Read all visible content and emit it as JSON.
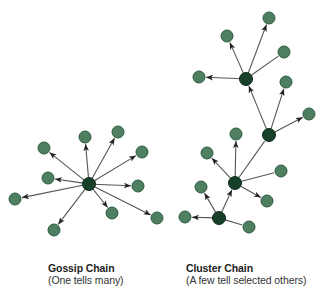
{
  "colors": {
    "hub_fill": "#17402a",
    "hub_stroke": "#0e2c1c",
    "leaf_fill": "#4d7f60",
    "leaf_stroke": "#2c5a3e",
    "edge": "#555555",
    "arrow": "#222222"
  },
  "diagrams": [
    {
      "id": "gossip",
      "title": "Gossip Chain",
      "subtitle": "(One tells many)",
      "nodes": [
        {
          "id": "g0",
          "x": 89,
          "y": 184,
          "type": "hub"
        },
        {
          "id": "g1",
          "x": 85,
          "y": 137,
          "type": "leaf"
        },
        {
          "id": "g2",
          "x": 118,
          "y": 132,
          "type": "leaf"
        },
        {
          "id": "g3",
          "x": 142,
          "y": 152,
          "type": "leaf"
        },
        {
          "id": "g4",
          "x": 44,
          "y": 148,
          "type": "leaf"
        },
        {
          "id": "g5",
          "x": 48,
          "y": 178,
          "type": "leaf"
        },
        {
          "id": "g6",
          "x": 138,
          "y": 186,
          "type": "leaf"
        },
        {
          "id": "g7",
          "x": 15,
          "y": 199,
          "type": "leaf"
        },
        {
          "id": "g8",
          "x": 112,
          "y": 213,
          "type": "leaf"
        },
        {
          "id": "g9",
          "x": 157,
          "y": 218,
          "type": "leaf"
        },
        {
          "id": "g10",
          "x": 54,
          "y": 230,
          "type": "leaf"
        }
      ],
      "edges": [
        {
          "from": "g0",
          "to": "g1",
          "arrow": true
        },
        {
          "from": "g0",
          "to": "g2",
          "arrow": true
        },
        {
          "from": "g0",
          "to": "g3",
          "arrow": true
        },
        {
          "from": "g0",
          "to": "g4",
          "arrow": true
        },
        {
          "from": "g0",
          "to": "g5",
          "arrow": true
        },
        {
          "from": "g0",
          "to": "g6",
          "arrow": true
        },
        {
          "from": "g0",
          "to": "g7",
          "arrow": true
        },
        {
          "from": "g0",
          "to": "g8",
          "arrow": true
        },
        {
          "from": "g0",
          "to": "g9",
          "arrow": true
        },
        {
          "from": "g0",
          "to": "g10",
          "arrow": true
        }
      ]
    },
    {
      "id": "cluster",
      "title": "Cluster Chain",
      "subtitle": "(A few tell selected others)",
      "nodes": [
        {
          "id": "h1",
          "x": 246,
          "y": 79,
          "type": "hub"
        },
        {
          "id": "h2",
          "x": 269,
          "y": 135,
          "type": "hub"
        },
        {
          "id": "h3",
          "x": 235,
          "y": 183,
          "type": "hub"
        },
        {
          "id": "h4",
          "x": 219,
          "y": 218,
          "type": "hub"
        },
        {
          "id": "c1",
          "x": 269,
          "y": 18,
          "type": "leaf"
        },
        {
          "id": "c2",
          "x": 227,
          "y": 36,
          "type": "leaf"
        },
        {
          "id": "c3",
          "x": 284,
          "y": 52,
          "type": "leaf"
        },
        {
          "id": "c4",
          "x": 199,
          "y": 77,
          "type": "leaf"
        },
        {
          "id": "c5",
          "x": 286,
          "y": 82,
          "type": "leaf"
        },
        {
          "id": "c6",
          "x": 309,
          "y": 114,
          "type": "leaf"
        },
        {
          "id": "c7",
          "x": 236,
          "y": 134,
          "type": "leaf"
        },
        {
          "id": "c8",
          "x": 207,
          "y": 153,
          "type": "leaf"
        },
        {
          "id": "c9",
          "x": 281,
          "y": 171,
          "type": "leaf"
        },
        {
          "id": "c10",
          "x": 201,
          "y": 187,
          "type": "leaf"
        },
        {
          "id": "c11",
          "x": 267,
          "y": 201,
          "type": "leaf"
        },
        {
          "id": "c12",
          "x": 185,
          "y": 217,
          "type": "leaf"
        },
        {
          "id": "c13",
          "x": 249,
          "y": 227,
          "type": "leaf"
        }
      ],
      "edges": [
        {
          "from": "h1",
          "to": "c1",
          "arrow": true
        },
        {
          "from": "h1",
          "to": "c2",
          "arrow": true
        },
        {
          "from": "h1",
          "to": "c3",
          "arrow": false
        },
        {
          "from": "h1",
          "to": "c4",
          "arrow": true
        },
        {
          "from": "h2",
          "to": "h1",
          "arrow": true
        },
        {
          "from": "h2",
          "to": "c5",
          "arrow": true
        },
        {
          "from": "h2",
          "to": "c6",
          "arrow": true
        },
        {
          "from": "h3",
          "to": "h2",
          "arrow": false
        },
        {
          "from": "h3",
          "to": "c7",
          "arrow": true
        },
        {
          "from": "h3",
          "to": "c8",
          "arrow": true
        },
        {
          "from": "h3",
          "to": "c9",
          "arrow": false
        },
        {
          "from": "h3",
          "to": "c11",
          "arrow": true
        },
        {
          "from": "h4",
          "to": "h3",
          "arrow": true
        },
        {
          "from": "h4",
          "to": "c10",
          "arrow": true
        },
        {
          "from": "h4",
          "to": "c12",
          "arrow": true
        },
        {
          "from": "h4",
          "to": "c13",
          "arrow": false
        }
      ]
    }
  ]
}
